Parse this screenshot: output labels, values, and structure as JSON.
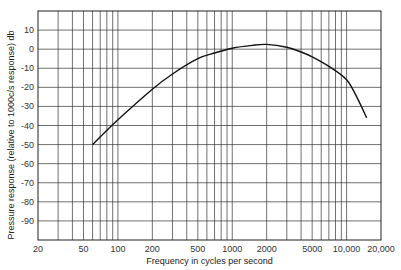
{
  "chart_data": {
    "type": "line",
    "title": "",
    "xlabel": "Frequency in cycles per second",
    "ylabel": "Pressure response (relative to 1000c/s response) db",
    "xscale": "log",
    "xlim": [
      20,
      20000
    ],
    "ylim": [
      -100,
      20
    ],
    "grid": true,
    "x_tick_labels": [
      "20",
      "50",
      "100",
      "200",
      "500",
      "1000",
      "2000",
      "5000",
      "10,000",
      "20,000"
    ],
    "x_ticks": [
      20,
      50,
      100,
      200,
      500,
      1000,
      2000,
      5000,
      10000,
      20000
    ],
    "y_ticks": [
      10,
      0,
      -10,
      -20,
      -30,
      -40,
      -50,
      -60,
      -70,
      -80,
      -90
    ],
    "y_tick_labels": [
      "10",
      "0",
      "-10",
      "-20",
      "-30",
      "-40",
      "-50",
      "-60",
      "-70",
      "-80",
      "-90"
    ],
    "series": [
      {
        "name": "Pressure response",
        "x": [
          60,
          100,
          200,
          300,
          500,
          700,
          1000,
          1500,
          2000,
          3000,
          4000,
          5000,
          7000,
          10000,
          12500,
          15000
        ],
        "y": [
          -50,
          -37,
          -21,
          -13,
          -5,
          -2,
          0.5,
          2,
          2.5,
          1,
          -1.5,
          -4,
          -9,
          -16,
          -26,
          -36
        ]
      }
    ]
  }
}
